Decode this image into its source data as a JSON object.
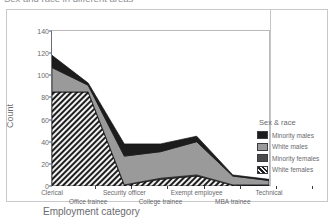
{
  "title": "Sex and race in different areas",
  "card": {
    "xaxis_title": "Employment category",
    "yaxis_title": "Count"
  },
  "legend": {
    "title": "Sex & race",
    "entries": [
      {
        "label": "Minority males",
        "color": "#1c1c1c",
        "pattern": "solid"
      },
      {
        "label": "White males",
        "color": "#9a9a9a",
        "pattern": "solid"
      },
      {
        "label": "Minority females",
        "color": "#4a4a4a",
        "pattern": "solid"
      },
      {
        "label": "White females",
        "color": "#2a2a2a",
        "pattern": "hatch"
      }
    ]
  },
  "chart_data": {
    "type": "area",
    "title": "Sex and race in different areas",
    "xlabel": "Employment category",
    "ylabel": "Count",
    "ylim": [
      0,
      140
    ],
    "yticks": [
      0,
      20,
      40,
      60,
      80,
      100,
      120,
      140
    ],
    "grid": false,
    "legend_position": "right",
    "stacked": true,
    "categories": [
      "Clerical",
      "Office trainee",
      "Security officer",
      "College trainee",
      "Exempt employee",
      "MBA trainee",
      "Technical"
    ],
    "series": [
      {
        "name": "White females",
        "values": [
          85,
          85,
          1,
          6,
          9,
          1,
          0
        ]
      },
      {
        "name": "Minority females",
        "values": [
          0,
          0,
          0,
          1,
          1,
          0,
          1
        ]
      },
      {
        "name": "White males",
        "values": [
          22,
          6,
          26,
          24,
          30,
          8,
          4
        ]
      },
      {
        "name": "Minority males",
        "values": [
          11,
          2,
          11,
          7,
          5,
          1,
          1
        ]
      }
    ],
    "totals": [
      118,
      93,
      38,
      38,
      45,
      10,
      6
    ]
  }
}
